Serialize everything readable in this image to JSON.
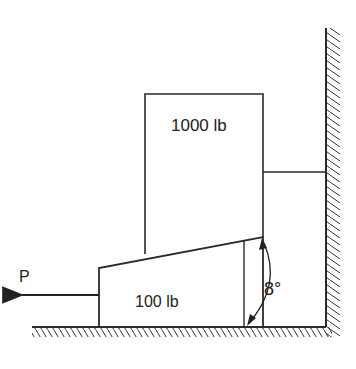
{
  "diagram": {
    "upper_block": {
      "label": "1000 lb"
    },
    "wedge": {
      "label": "100 lb"
    },
    "force": {
      "label": "P",
      "direction": "left"
    },
    "angle": {
      "label": "8°"
    },
    "colors": {
      "line": "#2a2a2a",
      "background": "#ffffff"
    }
  }
}
